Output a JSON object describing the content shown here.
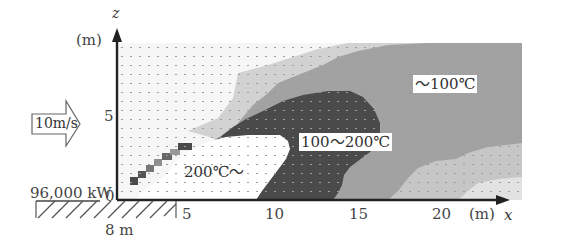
{
  "diagram": {
    "title": "",
    "axes": {
      "x": {
        "name": "x",
        "unit": "(m)",
        "ticks": [
          "0",
          "5",
          "10",
          "15",
          "20"
        ]
      },
      "z": {
        "name": "z",
        "unit": "(m)",
        "ticks": [
          "5"
        ]
      }
    },
    "wind": {
      "label": "10m/s",
      "icon": "right-arrow-icon"
    },
    "fire_source": {
      "power_label": "96,000 kW",
      "width_label": "8 m"
    },
    "regions": [
      {
        "id": "hot",
        "label": "200℃〜",
        "color": "#ffffff"
      },
      {
        "id": "mid",
        "label": "100〜200℃",
        "color": "#4a4a4a"
      },
      {
        "id": "low",
        "label": "〜100℃",
        "color": "#9a9a9a"
      }
    ],
    "colors": {
      "background_grid": "#f4f4f4",
      "light_gray": "#cfcfcf",
      "mid_gray": "#9a9a9a",
      "dark_gray": "#4a4a4a",
      "axis": "#222222"
    }
  }
}
